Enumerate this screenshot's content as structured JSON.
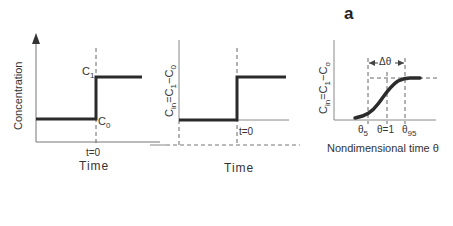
{
  "panel_letter": "a",
  "panel1": {
    "ylabel": "Concentration",
    "c1_label": "C",
    "c1_sub": "1",
    "c0_label": "C",
    "c0_sub": "0",
    "tick_label": "t=0",
    "xlabel": "Time"
  },
  "panel2": {
    "ylabel_main": "C",
    "ylabel_sub1": "in",
    "ylabel_eq": "=C",
    "ylabel_sub2": "1",
    "ylabel_minus": "−C",
    "ylabel_sub3": "0",
    "tick_label": "t=0",
    "xlabel": "Time"
  },
  "panel3": {
    "ylabel_main": "C",
    "ylabel_sub1": "in",
    "ylabel_eq": "=C",
    "ylabel_sub2": "1",
    "ylabel_minus": "−C",
    "ylabel_sub3": "o",
    "delta_label": "Δθ",
    "theta5": "θ",
    "theta5_sub": "5",
    "theta1": "θ=1",
    "theta95": "θ",
    "theta95_sub": "95",
    "xlabel": "Nondimensional time θ"
  },
  "colors": {
    "line": "#2b2b2b",
    "axis": "#777777",
    "dash": "#666666"
  }
}
